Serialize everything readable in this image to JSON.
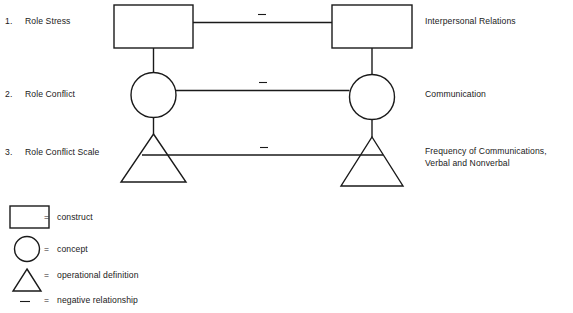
{
  "diagram": {
    "title_present": false,
    "colors": {
      "stroke": "#1a1a1a",
      "background": "#ffffff",
      "text": "#1a1a1a"
    },
    "rows": [
      {
        "number": "1.",
        "left_label": "Role Stress",
        "right_label_lines": [
          "Interpersonal Relations"
        ],
        "shape": "rectangle",
        "relationship_symbol": "–"
      },
      {
        "number": "2.",
        "left_label": "Role Conflict",
        "right_label_lines": [
          "Communication"
        ],
        "shape": "circle",
        "relationship_symbol": "–"
      },
      {
        "number": "3.",
        "left_label": "Role Conflict Scale",
        "right_label_lines": [
          "Frequency of Communications,",
          "Verbal and Nonverbal"
        ],
        "shape": "triangle",
        "relationship_symbol": "–"
      }
    ],
    "legend": {
      "equals_symbol": "=",
      "items": [
        {
          "shape": "rectangle",
          "equals": "=",
          "label": "construct"
        },
        {
          "shape": "circle",
          "equals": "=",
          "label": "concept"
        },
        {
          "shape": "triangle",
          "equals": "=",
          "label": "operational definition"
        },
        {
          "shape": "dash",
          "equals": "=",
          "label": "negative relationship"
        }
      ]
    }
  }
}
